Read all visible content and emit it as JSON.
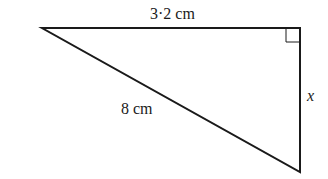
{
  "diagram": {
    "type": "right-triangle",
    "vertices": {
      "left": [
        42,
        28
      ],
      "right_angle": [
        300,
        28
      ],
      "bottom": [
        300,
        172
      ]
    },
    "labels": {
      "top_side": "3·2 cm",
      "hypotenuse": "8 cm",
      "right_side": "x"
    },
    "right_angle_marker": true,
    "colors": {
      "stroke": "#1a1a1a",
      "background": "#ffffff"
    }
  }
}
